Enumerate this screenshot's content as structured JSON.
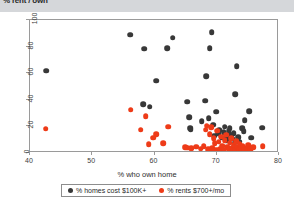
{
  "header": {
    "title": "% rent / own"
  },
  "colors": {
    "own": "#383838",
    "rent": "#ee3b18",
    "header_bar": "#d5d7da",
    "frame": "#9a9a9a"
  },
  "legend": {
    "entries": [
      {
        "label": "% homes cost $100K+",
        "color": "#383838",
        "marker": "circle"
      },
      {
        "label": "% rents $700+/mo",
        "color": "#ee3b18",
        "marker": "circle"
      }
    ]
  },
  "chart_data": {
    "type": "scatter",
    "title": "",
    "xlabel": "% who own home",
    "ylabel": "",
    "xlim": [
      40,
      80
    ],
    "ylim": [
      0,
      100
    ],
    "xticks": [
      40,
      50,
      60,
      70,
      80
    ],
    "yticks": [
      0,
      20,
      40,
      60,
      80,
      100
    ],
    "grid": false,
    "legend_position": "below-axes",
    "series": [
      {
        "name": "% homes cost $100K+",
        "color": "#383838",
        "points": [
          [
            42.6,
            62.0
          ],
          [
            56.1,
            89.0
          ],
          [
            58.3,
            78.5
          ],
          [
            58.2,
            36.8
          ],
          [
            59.2,
            34.8
          ],
          [
            60.3,
            54.3
          ],
          [
            62.0,
            79.0
          ],
          [
            62.9,
            86.8
          ],
          [
            65.3,
            38.6
          ],
          [
            65.6,
            27.0
          ],
          [
            65.7,
            18.8
          ],
          [
            65.8,
            17.6
          ],
          [
            67.6,
            23.8
          ],
          [
            68.1,
            39.4
          ],
          [
            68.3,
            57.6
          ],
          [
            68.7,
            26.2
          ],
          [
            68.9,
            78.6
          ],
          [
            69.2,
            91.0
          ],
          [
            69.4,
            21.4
          ],
          [
            69.6,
            13.0
          ],
          [
            69.9,
            31.2
          ],
          [
            70.2,
            14.4
          ],
          [
            70.4,
            17.2
          ],
          [
            70.8,
            11.4
          ],
          [
            71.1,
            15.8
          ],
          [
            71.3,
            19.8
          ],
          [
            71.5,
            9.8
          ],
          [
            71.7,
            12.6
          ],
          [
            71.9,
            16.4
          ],
          [
            72.1,
            18.6
          ],
          [
            72.3,
            13.4
          ],
          [
            72.5,
            10.6
          ],
          [
            72.7,
            14.8
          ],
          [
            72.9,
            7.6
          ],
          [
            73.0,
            44.2
          ],
          [
            73.2,
            65.2
          ],
          [
            73.4,
            11.8
          ],
          [
            73.6,
            8.4
          ],
          [
            74.1,
            18.6
          ],
          [
            74.3,
            16.4
          ],
          [
            74.5,
            24.8
          ],
          [
            75.2,
            31.6
          ],
          [
            75.5,
            11.6
          ],
          [
            77.3,
            19.0
          ]
        ]
      },
      {
        "name": "% rents $700+/mo",
        "color": "#ee3b18",
        "points": [
          [
            42.5,
            18.2
          ],
          [
            56.2,
            32.6
          ],
          [
            57.8,
            17.6
          ],
          [
            58.6,
            27.6
          ],
          [
            59.1,
            6.4
          ],
          [
            59.8,
            11.4
          ],
          [
            60.3,
            14.2
          ],
          [
            61.4,
            7.4
          ],
          [
            62.2,
            19.8
          ],
          [
            64.9,
            4.2
          ],
          [
            65.3,
            4.0
          ],
          [
            65.9,
            3.6
          ],
          [
            66.7,
            4.6
          ],
          [
            67.4,
            3.2
          ],
          [
            67.9,
            5.2
          ],
          [
            68.2,
            17.4
          ],
          [
            68.4,
            20.6
          ],
          [
            68.6,
            2.8
          ],
          [
            68.9,
            14.2
          ],
          [
            69.1,
            19.6
          ],
          [
            69.3,
            3.4
          ],
          [
            69.5,
            11.2
          ],
          [
            69.7,
            7.2
          ],
          [
            69.9,
            2.4
          ],
          [
            70.1,
            16.8
          ],
          [
            70.3,
            8.6
          ],
          [
            70.5,
            3.0
          ],
          [
            70.7,
            12.4
          ],
          [
            70.9,
            5.4
          ],
          [
            71.1,
            2.6
          ],
          [
            71.3,
            9.4
          ],
          [
            71.5,
            13.8
          ],
          [
            71.7,
            4.4
          ],
          [
            71.9,
            2.2
          ],
          [
            72.1,
            7.8
          ],
          [
            72.3,
            11.0
          ],
          [
            72.5,
            3.8
          ],
          [
            72.7,
            5.8
          ],
          [
            72.9,
            2.0
          ],
          [
            73.1,
            9.0
          ],
          [
            73.3,
            4.8
          ],
          [
            73.5,
            2.6
          ],
          [
            73.7,
            6.6
          ],
          [
            73.9,
            3.2
          ],
          [
            74.2,
            5.0
          ],
          [
            74.4,
            2.4
          ],
          [
            74.8,
            3.6
          ],
          [
            75.1,
            6.0
          ],
          [
            75.4,
            2.8
          ],
          [
            75.9,
            4.2
          ],
          [
            77.4,
            5.0
          ]
        ]
      }
    ]
  }
}
